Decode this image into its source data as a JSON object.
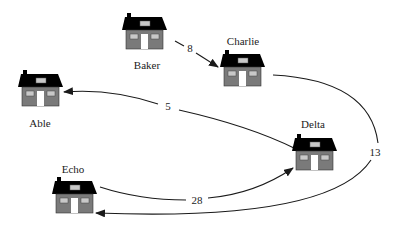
{
  "diagram": {
    "type": "directed-weighted-graph",
    "colors": {
      "roof": "#000000",
      "wall": "#7a7a7a",
      "window": "#c8c8c8",
      "door": "#ffffff",
      "edge": "#1a1a1a",
      "text": "#222222"
    },
    "nodes": [
      {
        "id": "baker",
        "label": "Baker",
        "icon": "house-icon"
      },
      {
        "id": "charlie",
        "label": "Charlie",
        "icon": "house-icon"
      },
      {
        "id": "able",
        "label": "Able",
        "icon": "house-icon"
      },
      {
        "id": "delta",
        "label": "Delta",
        "icon": "house-icon"
      },
      {
        "id": "echo",
        "label": "Echo",
        "icon": "house-icon"
      }
    ],
    "edges": [
      {
        "from": "Baker",
        "to": "Charlie",
        "weight": "8"
      },
      {
        "from": "Delta",
        "to": "Able",
        "weight": "5"
      },
      {
        "from": "Echo",
        "to": "Delta",
        "weight": "28"
      },
      {
        "from": "Charlie",
        "to": "Echo",
        "weight": "13"
      }
    ]
  }
}
